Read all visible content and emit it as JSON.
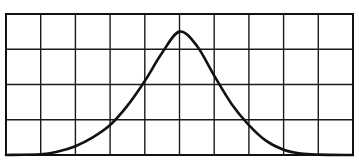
{
  "chart_data": {
    "type": "line",
    "title": "",
    "xlabel": "",
    "ylabel": "",
    "grid": true,
    "grid_columns": 10,
    "grid_rows": 4,
    "xlim": [
      0,
      10
    ],
    "ylim": [
      0,
      4
    ],
    "legend": null,
    "series": [
      {
        "name": "curve",
        "x": [
          0,
          1,
          1.5,
          2,
          2.5,
          3,
          3.5,
          4,
          4.5,
          5,
          5.5,
          6,
          6.5,
          7,
          7.5,
          8,
          8.5,
          9,
          10
        ],
        "y": [
          0,
          0.02,
          0.1,
          0.25,
          0.5,
          0.85,
          1.4,
          2.1,
          2.9,
          3.5,
          3.1,
          2.25,
          1.45,
          0.85,
          0.4,
          0.15,
          0.04,
          0.01,
          0
        ]
      }
    ],
    "colors": {
      "line": "#111111",
      "grid": "#1a1a1a",
      "background": "#ffffff"
    }
  }
}
